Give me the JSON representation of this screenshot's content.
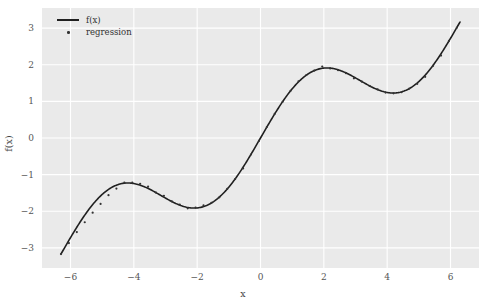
{
  "chart_data": {
    "type": "line",
    "title": "",
    "xlabel": "x",
    "ylabel": "f(x)",
    "xlim": [
      -6.9,
      6.9
    ],
    "ylim": [
      -3.55,
      3.55
    ],
    "xticks": [
      -6,
      -4,
      -2,
      0,
      2,
      4,
      6
    ],
    "xtick_labels": [
      "−6",
      "−4",
      "−2",
      "0",
      "2",
      "4",
      "6"
    ],
    "yticks": [
      3,
      2,
      1,
      0,
      -1,
      -2,
      -3
    ],
    "ytick_labels": [
      "3",
      "2",
      "1",
      "0",
      "−1",
      "−2",
      "−3"
    ],
    "grid": true,
    "grid_color": "#ffffff",
    "plot_bgcolor": "#eaeaea",
    "figure_bgcolor": "#ffffff",
    "legend_position": "upper-left",
    "series": [
      {
        "name": "f(x)",
        "type": "line",
        "color": "#202020",
        "linewidth": 1.6,
        "x": [
          -6.3,
          -6.0,
          -5.7,
          -5.4,
          -5.1,
          -4.8,
          -4.5,
          -4.2,
          -3.9,
          -3.6,
          -3.3,
          -3.0,
          -2.7,
          -2.4,
          -2.1,
          -1.8,
          -1.5,
          -1.2,
          -0.9,
          -0.6,
          -0.3,
          0.0,
          0.3,
          0.6,
          0.9,
          1.2,
          1.5,
          1.8,
          2.1,
          2.4,
          2.7,
          3.0,
          3.3,
          3.6,
          3.9,
          4.2,
          4.5,
          4.8,
          5.1,
          5.4,
          5.7,
          6.0,
          6.3
        ],
        "y": [
          -3.13,
          -2.72,
          -2.44,
          -2.13,
          -1.63,
          -1.41,
          -1.27,
          -1.23,
          -1.27,
          -1.36,
          -1.49,
          -1.64,
          -1.78,
          -1.87,
          -1.91,
          -1.87,
          -1.75,
          -1.53,
          -1.23,
          -0.86,
          -0.45,
          0.0,
          0.45,
          0.86,
          1.23,
          1.53,
          1.75,
          1.87,
          1.91,
          1.87,
          1.78,
          1.64,
          1.49,
          1.36,
          1.27,
          1.23,
          1.27,
          1.41,
          1.63,
          2.13,
          2.44,
          2.72,
          3.13
        ],
        "equation": "sin(x) + x/2"
      },
      {
        "name": "regression",
        "type": "scatter",
        "color": "#333333",
        "marker": "point",
        "markersize": 2.2,
        "x": [
          -6.3,
          -6.05,
          -5.8,
          -5.55,
          -5.3,
          -5.05,
          -4.8,
          -4.55,
          -4.3,
          -4.05,
          -3.8,
          -3.55,
          -3.3,
          -3.05,
          -2.8,
          -2.55,
          -2.3,
          -2.05,
          -1.8,
          -1.55,
          -1.3,
          -1.05,
          -0.8,
          -0.55,
          -0.3,
          -0.05,
          0.2,
          0.45,
          0.7,
          0.95,
          1.2,
          1.45,
          1.7,
          1.95,
          2.2,
          2.45,
          2.7,
          2.95,
          3.2,
          3.45,
          3.7,
          3.95,
          4.2,
          4.45,
          4.7,
          4.95,
          5.2,
          5.45,
          5.7,
          5.95,
          6.2
        ],
        "y": [
          -3.17,
          -2.87,
          -2.57,
          -2.3,
          -2.04,
          -1.8,
          -1.56,
          -1.38,
          -1.22,
          -1.22,
          -1.25,
          -1.33,
          -1.49,
          -1.58,
          -1.73,
          -1.82,
          -1.92,
          -1.9,
          -1.84,
          -1.77,
          -1.62,
          -1.39,
          -1.12,
          -0.83,
          -0.45,
          -0.08,
          0.3,
          0.66,
          0.99,
          1.29,
          1.55,
          1.72,
          1.84,
          1.95,
          1.9,
          1.85,
          1.77,
          1.63,
          1.54,
          1.42,
          1.33,
          1.24,
          1.22,
          1.25,
          1.35,
          1.48,
          1.67,
          1.97,
          2.25,
          2.65,
          3.01
        ]
      }
    ]
  },
  "legend": {
    "entries": [
      {
        "label": "f(x)",
        "marker": "line"
      },
      {
        "label": "regression",
        "marker": "dot"
      }
    ]
  }
}
